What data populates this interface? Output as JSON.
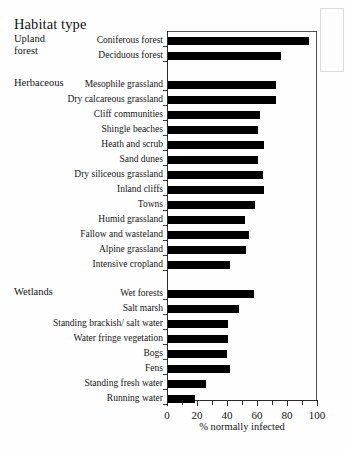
{
  "title": "Habitat type",
  "groups": [
    {
      "name": "upland-forest",
      "label": "Upland\nforest"
    },
    {
      "name": "herbaceous",
      "label": "Herbaceous"
    },
    {
      "name": "wetlands",
      "label": "Wetlands"
    }
  ],
  "axis": {
    "xlabel": "% normally infected",
    "ticklabels": [
      "0",
      "20",
      "40",
      "60",
      "80",
      "100"
    ],
    "tickvalues": [
      0,
      20,
      40,
      60,
      80,
      100
    ],
    "minorstep": 10,
    "xlim": [
      0,
      100
    ]
  },
  "chart_data": {
    "type": "bar",
    "orientation": "horizontal",
    "title": "Habitat type",
    "xlabel": "% normally infected",
    "ylabel": "Habitat type",
    "xlim": [
      0,
      100
    ],
    "grid": false,
    "legend": null,
    "groups": [
      {
        "label": "Upland forest",
        "categories": [
          "Coniferous forest",
          "Deciduous forest"
        ],
        "values": [
          94,
          75
        ]
      },
      {
        "label": "Herbaceous",
        "categories": [
          "Mesophile grassland",
          "Dry calcareous grassland",
          "Cliff communities",
          "Shingle beaches",
          "Heath and scrub",
          "Sand dunes",
          "Dry siliceous grassland",
          "Inland cliffs",
          "Towns",
          "Humid grassland",
          "Fallow and wasteland",
          "Alpine grassland",
          "Intensive cropland"
        ],
        "values": [
          72,
          72,
          61,
          60,
          64,
          60,
          63,
          64,
          58,
          51,
          54,
          52,
          41
        ]
      },
      {
        "label": "Wetlands",
        "categories": [
          "Wet forests",
          "Salt marsh",
          "Standing brackish/ salt water",
          "Water fringe vegetation",
          "Bogs",
          "Fens",
          "Standing fresh water",
          "Running water"
        ],
        "values": [
          57,
          47,
          40,
          40,
          39,
          41,
          25,
          18
        ]
      }
    ],
    "categories": [
      "Coniferous forest",
      "Deciduous forest",
      "Mesophile grassland",
      "Dry calcareous grassland",
      "Cliff communities",
      "Shingle beaches",
      "Heath and scrub",
      "Sand dunes",
      "Dry siliceous grassland",
      "Inland cliffs",
      "Towns",
      "Humid grassland",
      "Fallow and wasteland",
      "Alpine grassland",
      "Intensive cropland",
      "Wet forests",
      "Salt marsh",
      "Standing brackish/ salt water",
      "Water fringe vegetation",
      "Bogs",
      "Fens",
      "Standing fresh water",
      "Running water"
    ],
    "values": [
      94,
      75,
      72,
      72,
      61,
      60,
      64,
      60,
      63,
      64,
      58,
      51,
      54,
      52,
      41,
      57,
      47,
      40,
      40,
      39,
      41,
      25,
      18
    ],
    "bar_color": "#000000"
  }
}
